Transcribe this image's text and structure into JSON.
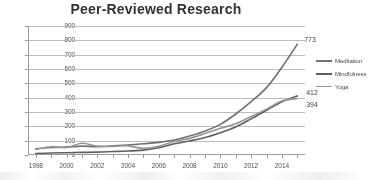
{
  "chart_data": {
    "type": "line",
    "title": "Peer-Reviewed Research",
    "xlabel": "",
    "ylabel": "",
    "xlim": [
      1997.5,
      2015.5
    ],
    "ylim": [
      0,
      900
    ],
    "grid": true,
    "legend_position": "right",
    "x": [
      1998,
      1999,
      2000,
      2001,
      2002,
      2003,
      2004,
      2005,
      2006,
      2007,
      2008,
      2009,
      2010,
      2011,
      2012,
      2013,
      2014,
      2015
    ],
    "y_ticks": [
      0,
      100,
      200,
      300,
      400,
      500,
      600,
      700,
      800,
      900
    ],
    "x_ticks": [
      1998,
      2000,
      2002,
      2004,
      2006,
      2008,
      2010,
      2012,
      2014
    ],
    "series": [
      {
        "name": "Meditation",
        "color": "#6d6d6d",
        "values": [
          44,
          52,
          56,
          62,
          58,
          64,
          70,
          78,
          88,
          104,
          132,
          168,
          214,
          286,
          372,
          470,
          612,
          773
        ],
        "end_label": "773"
      },
      {
        "name": "Mindfulness",
        "color": "#5a5a5a",
        "values": [
          10,
          14,
          16,
          18,
          20,
          24,
          28,
          34,
          50,
          78,
          98,
          122,
          156,
          196,
          252,
          312,
          372,
          412
        ],
        "end_label": "412"
      },
      {
        "name": "Yoga",
        "color": "#949494",
        "values": [
          40,
          58,
          52,
          82,
          62,
          60,
          64,
          46,
          60,
          94,
          116,
          150,
          186,
          218,
          268,
          320,
          376,
          394
        ],
        "end_label": "394"
      }
    ],
    "annotations": [
      {
        "text": "773",
        "series": "Meditation"
      },
      {
        "text": "412",
        "series": "Mindfulness"
      },
      {
        "text": "394",
        "series": "Yoga"
      }
    ]
  }
}
